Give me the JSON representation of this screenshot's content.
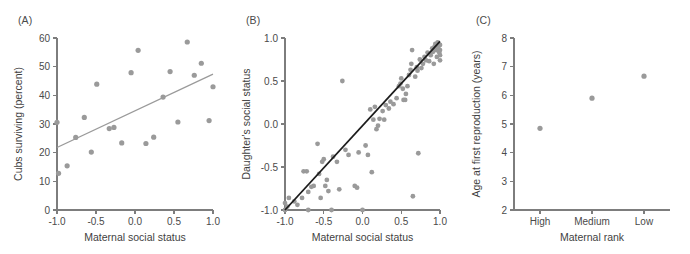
{
  "figure": {
    "background_color": "#ffffff",
    "point_color": "#9a9a9a",
    "axis_color": "#7d7d7d",
    "trend_color": "#9a9a9a",
    "diagonal_color": "#1c1c1c"
  },
  "panels": {
    "a": {
      "label": "(A)"
    },
    "b": {
      "label": "(B)"
    },
    "c": {
      "label": "(C)"
    }
  },
  "chart_data": [
    {
      "panel": "A",
      "type": "scatter",
      "title": "(A)",
      "xlabel": "Maternal social status",
      "ylabel": "Cubs surviving (percent)",
      "xlim": [
        -1.0,
        1.0
      ],
      "ylim": [
        0,
        60
      ],
      "xticks": [
        -1.0,
        -0.5,
        0.0,
        0.5,
        1.0
      ],
      "xticklabels": [
        "-1.0",
        "-0.5",
        "0.0",
        "0.5",
        "1.0"
      ],
      "yticks": [
        0,
        10,
        20,
        30,
        40,
        50,
        60
      ],
      "yticklabels": [
        "0",
        "10",
        "20",
        "30",
        "40",
        "50",
        "60"
      ],
      "grid": false,
      "legend": "none",
      "points": [
        [
          -1.0,
          30.6
        ],
        [
          -0.98,
          12.8
        ],
        [
          -0.87,
          15.4
        ],
        [
          -0.76,
          25.3
        ],
        [
          -0.65,
          32.3
        ],
        [
          -0.56,
          20.2
        ],
        [
          -0.49,
          43.9
        ],
        [
          -0.33,
          28.4
        ],
        [
          -0.27,
          28.8
        ],
        [
          -0.17,
          23.4
        ],
        [
          -0.05,
          47.9
        ],
        [
          0.04,
          55.7
        ],
        [
          0.14,
          23.2
        ],
        [
          0.24,
          25.4
        ],
        [
          0.36,
          39.4
        ],
        [
          0.45,
          48.3
        ],
        [
          0.55,
          30.7
        ],
        [
          0.67,
          58.6
        ],
        [
          0.76,
          47.0
        ],
        [
          0.85,
          51.2
        ],
        [
          0.95,
          31.2
        ],
        [
          1.0,
          43.0
        ]
      ],
      "trend_line": {
        "x": [
          -1.0,
          1.0
        ],
        "y": [
          21.8,
          47.4
        ]
      }
    },
    {
      "panel": "B",
      "type": "scatter",
      "title": "(B)",
      "xlabel": "Maternal social status",
      "ylabel": "Daughter's social status",
      "xlim": [
        -1.0,
        1.0
      ],
      "ylim": [
        -1.0,
        1.0
      ],
      "xticks": [
        -1.0,
        -0.5,
        0.0,
        0.5,
        1.0
      ],
      "xticklabels": [
        "-1.0",
        "-0.5",
        "0.0",
        "0.5",
        "1.0"
      ],
      "yticks": [
        -1.0,
        -0.5,
        0.0,
        0.5,
        1.0
      ],
      "yticklabels": [
        "-1.0",
        "-0.5",
        "0.0",
        "0.5",
        "1.0"
      ],
      "grid": false,
      "legend": "none",
      "reference_line": {
        "x": [
          -1.0,
          1.0
        ],
        "y": [
          -1.0,
          0.96
        ],
        "style": "solid",
        "color": "#1c1c1c"
      },
      "points": [
        [
          -1.0,
          -0.92
        ],
        [
          -1.0,
          -1.0
        ],
        [
          -0.97,
          -0.96
        ],
        [
          -0.95,
          -0.86
        ],
        [
          -0.88,
          -0.9
        ],
        [
          -0.84,
          -0.94
        ],
        [
          -0.78,
          -0.86
        ],
        [
          -0.76,
          -0.55
        ],
        [
          -0.72,
          -0.55
        ],
        [
          -0.7,
          -0.79
        ],
        [
          -0.7,
          -1.0
        ],
        [
          -0.66,
          -0.73
        ],
        [
          -0.63,
          -0.72
        ],
        [
          -0.58,
          -0.23
        ],
        [
          -0.56,
          -0.58
        ],
        [
          -0.54,
          -0.86
        ],
        [
          -0.52,
          -0.44
        ],
        [
          -0.5,
          -0.41
        ],
        [
          -0.48,
          -0.72
        ],
        [
          -0.46,
          -0.65
        ],
        [
          -0.44,
          -0.78
        ],
        [
          -0.4,
          -1.0
        ],
        [
          -0.38,
          -0.38
        ],
        [
          -0.33,
          -0.44
        ],
        [
          -0.3,
          -0.76
        ],
        [
          -0.26,
          0.5
        ],
        [
          -0.22,
          -0.3
        ],
        [
          -0.18,
          -0.36
        ],
        [
          -0.1,
          -0.72
        ],
        [
          -0.07,
          -0.74
        ],
        [
          -0.05,
          -0.33
        ],
        [
          0.0,
          -1.0
        ],
        [
          0.04,
          -0.25
        ],
        [
          0.07,
          -0.36
        ],
        [
          0.1,
          0.17
        ],
        [
          0.12,
          -0.56
        ],
        [
          0.14,
          0.05
        ],
        [
          0.16,
          0.2
        ],
        [
          0.18,
          -0.06
        ],
        [
          0.2,
          -0.02
        ],
        [
          0.22,
          0.06
        ],
        [
          0.26,
          0.15
        ],
        [
          0.28,
          0.05
        ],
        [
          0.3,
          0.22
        ],
        [
          0.34,
          0.18
        ],
        [
          0.36,
          0.26
        ],
        [
          0.4,
          0.23
        ],
        [
          0.44,
          0.3
        ],
        [
          0.47,
          0.44
        ],
        [
          0.49,
          0.47
        ],
        [
          0.5,
          0.53
        ],
        [
          0.52,
          0.41
        ],
        [
          0.53,
          0.28
        ],
        [
          0.55,
          0.28
        ],
        [
          0.56,
          0.35
        ],
        [
          0.58,
          0.44
        ],
        [
          0.6,
          0.57
        ],
        [
          0.62,
          0.63
        ],
        [
          0.63,
          0.7
        ],
        [
          0.64,
          0.86
        ],
        [
          0.65,
          -0.84
        ],
        [
          0.68,
          0.55
        ],
        [
          0.7,
          0.66
        ],
        [
          0.71,
          0.62
        ],
        [
          0.72,
          -0.34
        ],
        [
          0.74,
          0.75
        ],
        [
          0.76,
          0.65
        ],
        [
          0.78,
          0.7
        ],
        [
          0.8,
          0.78
        ],
        [
          0.82,
          0.74
        ],
        [
          0.84,
          0.83
        ],
        [
          0.86,
          0.73
        ],
        [
          0.88,
          0.8
        ],
        [
          0.9,
          0.88
        ],
        [
          0.91,
          0.84
        ],
        [
          0.93,
          0.9
        ],
        [
          0.94,
          0.93
        ],
        [
          0.95,
          0.86
        ],
        [
          0.96,
          0.91
        ],
        [
          0.97,
          0.95
        ],
        [
          0.98,
          0.88
        ],
        [
          0.99,
          0.83
        ],
        [
          1.0,
          0.92
        ],
        [
          1.0,
          0.86
        ],
        [
          1.0,
          0.8
        ],
        [
          1.0,
          0.74
        ],
        [
          0.96,
          0.78
        ],
        [
          0.92,
          0.7
        ]
      ]
    },
    {
      "panel": "C",
      "type": "scatter",
      "title": "(C)",
      "xlabel": "Maternal rank",
      "ylabel": "Age at first reproduction (years)",
      "categories": [
        "High",
        "Medium",
        "Low"
      ],
      "values": [
        4.85,
        5.9,
        6.67
      ],
      "ylim": [
        2,
        8
      ],
      "yticks": [
        2,
        3,
        4,
        5,
        6,
        7,
        8
      ],
      "yticklabels": [
        "2",
        "3",
        "4",
        "5",
        "6",
        "7",
        "8"
      ],
      "xticklabels": [
        "High",
        "Medium",
        "Low"
      ],
      "grid": false,
      "legend": "none"
    }
  ]
}
